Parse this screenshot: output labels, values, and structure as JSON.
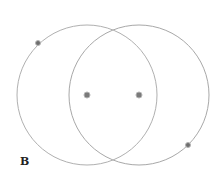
{
  "diagram": {
    "label": "B",
    "circles": [
      {
        "name": "left-circle",
        "cx": 87,
        "cy": 95,
        "r": 70,
        "stroke": "#b0b0b0"
      },
      {
        "name": "right-circle",
        "cx": 139,
        "cy": 95,
        "r": 70,
        "stroke": "#a8a8a8"
      }
    ],
    "points": [
      {
        "name": "left-center-point",
        "x": 87,
        "y": 95
      },
      {
        "name": "right-center-point",
        "x": 139,
        "y": 95
      },
      {
        "name": "left-circle-point",
        "x": 38,
        "y": 43
      },
      {
        "name": "right-circle-point",
        "x": 188,
        "y": 145
      }
    ],
    "point_color": "#7a7a7a"
  }
}
